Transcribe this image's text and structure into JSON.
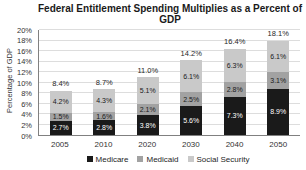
{
  "window": {
    "width": 306,
    "height": 170
  },
  "colors": {
    "background": "#ffffff",
    "gridline": "#dddddd",
    "axis_line": "#808080",
    "title_text": "#1a1a1a",
    "tick_text": "#333333"
  },
  "chart_data": {
    "type": "bar",
    "stacked": true,
    "title": "Federal Entitlement Spending Multiplies as a Percent of GDP",
    "xlabel": "",
    "ylabel": "Percentage of GDP",
    "ylim": [
      0,
      20
    ],
    "ytick_step": 2,
    "ytick_suffix": "%",
    "grid": true,
    "legend_position": "bottom",
    "categories": [
      "2005",
      "2010",
      "2020",
      "2030",
      "2040",
      "2050"
    ],
    "series": [
      {
        "name": "Medicare",
        "color": "#1a1a1a",
        "label_color": "#ffffff",
        "values": [
          2.7,
          2.8,
          3.8,
          5.6,
          7.3,
          8.9
        ],
        "labels": [
          "2.7%",
          "2.8%",
          "3.8%",
          "5.6%",
          "7.3%",
          "8.9%"
        ]
      },
      {
        "name": "Medicaid",
        "color": "#a2a2a2",
        "label_color": "#1a1a1a",
        "values": [
          1.5,
          1.6,
          2.1,
          2.5,
          2.8,
          3.1
        ],
        "labels": [
          "1.5%",
          "1.6%",
          "2.1%",
          "2.5%",
          "2.8%",
          "3.1%"
        ]
      },
      {
        "name": "Social Security",
        "color": "#c9c9c9",
        "label_color": "#1a1a1a",
        "values": [
          4.2,
          4.3,
          5.1,
          6.1,
          6.3,
          6.1
        ],
        "labels": [
          "4.2%",
          "4.3%",
          "5.1%",
          "6.1%",
          "6.3%",
          "6.1%"
        ]
      }
    ],
    "totals": {
      "values": [
        8.4,
        8.7,
        11.0,
        14.2,
        16.4,
        18.1
      ],
      "labels": [
        "8.4%",
        "8.7%",
        "11.0%",
        "14.2%",
        "16.4%",
        "18.1%"
      ]
    }
  }
}
